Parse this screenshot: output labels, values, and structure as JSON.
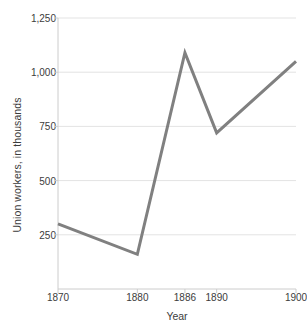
{
  "chart_data": {
    "type": "line",
    "title": "",
    "xlabel": "Year",
    "ylabel": "Union workers, in thousands",
    "x": [
      1870,
      1880,
      1886,
      1890,
      1900
    ],
    "values": [
      300,
      160,
      1090,
      720,
      1050
    ],
    "series": [
      {
        "name": "Union workers",
        "values": [
          300,
          160,
          1090,
          720,
          1050
        ]
      }
    ],
    "x_tick_labels": [
      "1870",
      "1880",
      "1886",
      "1890",
      "1900"
    ],
    "y_tick_labels": [
      "250",
      "500",
      "750",
      "1,000",
      "1,250"
    ],
    "y_ticks": [
      250,
      500,
      750,
      1000,
      1250
    ],
    "xlim": [
      1870,
      1900
    ],
    "ylim": [
      0,
      1250
    ],
    "grid": "horizontal",
    "legend": "none",
    "line_color": "#808080",
    "grid_color": "#e3e3e3",
    "axis_color": "#cccccc",
    "text_color": "#3c3c3c",
    "background": "#ffffff"
  }
}
